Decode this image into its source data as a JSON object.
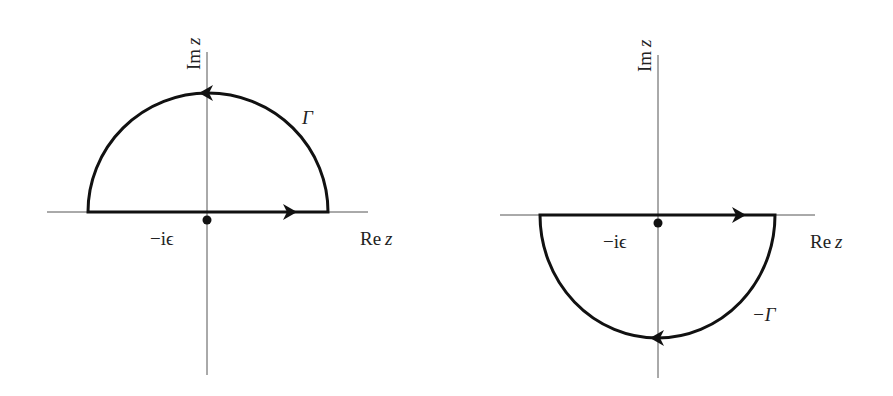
{
  "figure": {
    "type": "contour-integral-diagram",
    "panels": [
      {
        "id": "upper",
        "axis_labels": {
          "vertical": "Im z",
          "vertical_main": "Im",
          "vertical_var": "z",
          "horizontal": "Re z",
          "horizontal_main": "Re",
          "horizontal_var": "z"
        },
        "pole_label": "−iϵ",
        "contour_label": "Γ",
        "contour_half": "upper",
        "direction": "counter-clockwise"
      },
      {
        "id": "lower",
        "axis_labels": {
          "vertical": "Im z",
          "vertical_main": "Im",
          "vertical_var": "z",
          "horizontal": "Re z",
          "horizontal_main": "Re",
          "horizontal_var": "z"
        },
        "pole_label": "−iϵ",
        "contour_label": "−Γ",
        "contour_half": "lower",
        "direction": "clockwise"
      }
    ],
    "colors": {
      "contour": "#111111",
      "axis": "#555555",
      "text": "#222222",
      "background": "#ffffff"
    }
  }
}
